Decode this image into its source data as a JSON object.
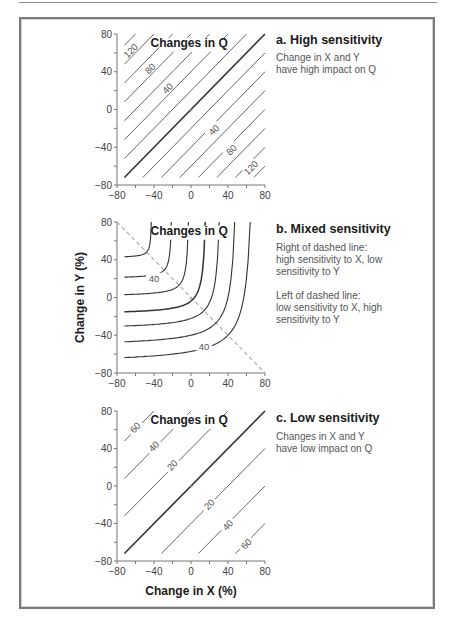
{
  "chart_data": [
    {
      "id": "a",
      "type": "line",
      "subtype": "contour",
      "title": "a. High sensitivity",
      "description": "Change in X and Y\nhave high impact on Q",
      "inner_title": "Changes in Q",
      "xlim": [
        -80,
        80
      ],
      "ylim": [
        -80,
        80
      ],
      "xticks": [
        -80,
        -40,
        0,
        40,
        80
      ],
      "yticks": [
        80,
        40,
        0,
        -40,
        -80
      ],
      "contour_form": "y = x + c",
      "contours_c": [
        140,
        120,
        100,
        80,
        60,
        40,
        20,
        0,
        -20,
        -40,
        -60,
        -80,
        -100,
        -120,
        -140
      ],
      "bold_c": 0,
      "contour_labels": [
        {
          "text": "120",
          "x": -65,
          "y": 62
        },
        {
          "text": "80",
          "x": -44,
          "y": 43
        },
        {
          "text": "40",
          "x": -25,
          "y": 22
        },
        {
          "text": "40",
          "x": 25,
          "y": -22
        },
        {
          "text": "80",
          "x": 44,
          "y": -43
        },
        {
          "text": "120",
          "x": 65,
          "y": -62
        }
      ]
    },
    {
      "id": "b",
      "type": "line",
      "subtype": "contour",
      "title": "b. Mixed sensitivity",
      "description": "Right of dashed line:\nhigh sensitivity to X, low\nsensitivity to Y\n\nLeft of dashed line:\nlow sensitivity to X, high\nsensitivity to Y",
      "inner_title": "Changes in Q",
      "ylabel": "Change in Y (%)",
      "xlim": [
        -80,
        80
      ],
      "ylim": [
        -80,
        80
      ],
      "xticks": [
        -80,
        -40,
        0,
        40,
        80
      ],
      "yticks": [
        80,
        40,
        0,
        -40,
        -80
      ],
      "dashed_line": {
        "from": [
          -80,
          80
        ],
        "to": [
          80,
          -80
        ]
      },
      "curves": [
        {
          "asymptote": 42,
          "k": 6
        },
        {
          "asymptote": 20,
          "k": 9
        },
        {
          "asymptote": 1,
          "k": 12
        },
        {
          "asymptote": -18,
          "k": 16,
          "bold": true
        },
        {
          "asymptote": -34,
          "k": 20
        },
        {
          "asymptote": -52,
          "k": 25
        },
        {
          "asymptote": -70,
          "k": 30
        }
      ],
      "contour_labels": [
        {
          "text": "40",
          "x": -40,
          "y": 20
        },
        {
          "text": "40",
          "x": 14,
          "y": -52
        }
      ]
    },
    {
      "id": "c",
      "type": "line",
      "subtype": "contour",
      "title": "c. Low sensitivity",
      "description": "Changes in X and Y\nhave low impact on Q",
      "inner_title": "Changes in Q",
      "xlabel": "Change in X (%)",
      "xlim": [
        -80,
        80
      ],
      "ylim": [
        -80,
        80
      ],
      "xticks": [
        -80,
        -40,
        0,
        40,
        80
      ],
      "yticks": [
        80,
        40,
        0,
        -40,
        -80
      ],
      "contour_form": "y = x + c",
      "contours_c": [
        120,
        80,
        40,
        0,
        -40,
        -80,
        -120
      ],
      "bold_c": 0,
      "contour_labels": [
        {
          "text": "60",
          "x": -60,
          "y": 62
        },
        {
          "text": "40",
          "x": -40,
          "y": 42
        },
        {
          "text": "20",
          "x": -20,
          "y": 22
        },
        {
          "text": "20",
          "x": 20,
          "y": -20
        },
        {
          "text": "40",
          "x": 40,
          "y": -42
        },
        {
          "text": "60",
          "x": 60,
          "y": -62
        }
      ]
    }
  ]
}
